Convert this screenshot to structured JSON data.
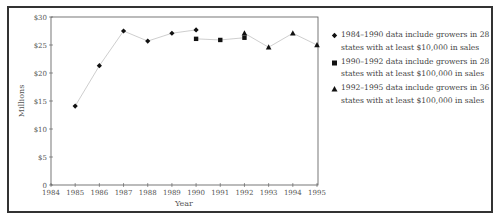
{
  "chart_data": {
    "type": "line",
    "title": "",
    "xlabel": "Year",
    "ylabel": "Millions",
    "xlim": [
      1984,
      1995
    ],
    "ylim": [
      0,
      30
    ],
    "x_ticks": [
      "1984",
      "1985",
      "1986",
      "1987",
      "1988",
      "1989",
      "1990",
      "1991",
      "1992",
      "1993",
      "1994",
      "1995"
    ],
    "y_ticks": [
      "0",
      "$5",
      "$10",
      "$15",
      "$20",
      "$25",
      "$30"
    ],
    "grid": false,
    "legend_position": "right",
    "series": [
      {
        "name": "1984–1990 data include growers in 28 states with at least $10,000 in sales",
        "marker": "diamond",
        "x": [
          1985,
          1986,
          1987,
          1988,
          1989,
          1990
        ],
        "values": [
          14.1,
          21.3,
          27.5,
          25.7,
          27.1,
          27.7
        ]
      },
      {
        "name": "1990–1992 data include growers in 28 states with at least $100,000 in sales",
        "marker": "square",
        "x": [
          1990,
          1991,
          1992
        ],
        "values": [
          26.1,
          25.9,
          26.3
        ]
      },
      {
        "name": "1992–1995 data include growers in 36 states with at least $100,000 in sales",
        "marker": "triangle",
        "x": [
          1992,
          1993,
          1994,
          1995
        ],
        "values": [
          27.1,
          24.6,
          27.1,
          25.0
        ]
      }
    ]
  },
  "legend": [
    {
      "line1": "1984–1990 data include growers in 28",
      "line2": "states with at least $10,000 in sales"
    },
    {
      "line1": "1990–1992 data include growers in 28",
      "line2": "states with at least $100,000 in sales"
    },
    {
      "line1": "1992–1995 data include growers in 36",
      "line2": "states with at least $100,000 in sales"
    }
  ],
  "colors": {
    "line": "#c8c8c8",
    "marker": "#111111",
    "axis": "#555555",
    "frame": "#333333"
  }
}
